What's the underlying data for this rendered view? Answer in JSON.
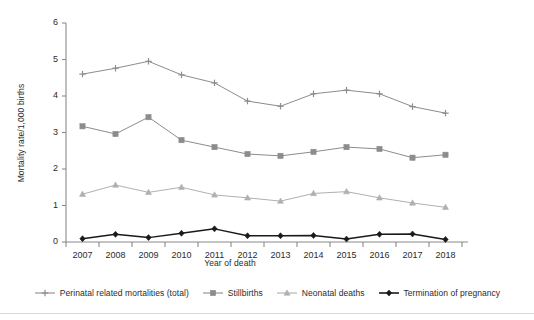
{
  "chart_data": {
    "type": "line",
    "title": "",
    "xlabel": "Year of death",
    "ylabel": "Mortality rate/1,000 births",
    "categories": [
      "2007",
      "2008",
      "2009",
      "2010",
      "2011",
      "2012",
      "2013",
      "2014",
      "2015",
      "2016",
      "2017",
      "2018"
    ],
    "x": [
      2007,
      2008,
      2009,
      2010,
      2011,
      2012,
      2013,
      2014,
      2015,
      2016,
      2017,
      2018
    ],
    "xlim": [
      2006.5,
      2018.5
    ],
    "ylim": [
      0,
      6
    ],
    "yticks": [
      0,
      1,
      2,
      3,
      4,
      5,
      6
    ],
    "ytick_labels": [
      "0",
      "1",
      "2",
      "3",
      "4",
      "5",
      "6"
    ],
    "grid": false,
    "legend_position": "bottom",
    "series": [
      {
        "name": "Perinatal related mortalities (total)",
        "marker": "plus",
        "color": "#8c8c8c",
        "values": [
          4.6,
          4.76,
          4.95,
          4.58,
          4.36,
          3.86,
          3.72,
          4.06,
          4.16,
          4.06,
          3.71,
          3.53
        ]
      },
      {
        "name": "Stillbirths",
        "marker": "square",
        "color": "#8c8c8c",
        "values": [
          3.17,
          2.96,
          3.42,
          2.79,
          2.6,
          2.41,
          2.36,
          2.47,
          2.6,
          2.55,
          2.31,
          2.39
        ]
      },
      {
        "name": "Neonatal deaths",
        "marker": "triangle",
        "color": "#b0b0b0",
        "values": [
          1.31,
          1.56,
          1.36,
          1.5,
          1.29,
          1.21,
          1.12,
          1.33,
          1.38,
          1.21,
          1.07,
          0.95
        ]
      },
      {
        "name": "Termination of pregnancy",
        "marker": "diamond",
        "color": "#1a1a1a",
        "values": [
          0.09,
          0.21,
          0.12,
          0.24,
          0.36,
          0.17,
          0.17,
          0.18,
          0.08,
          0.21,
          0.22,
          0.07
        ]
      }
    ]
  },
  "axes": {
    "y_title": "Mortality rate/1,000 births",
    "x_title": "Year of death"
  },
  "legend": {
    "items": [
      {
        "label": "Perinatal related mortalities (total)",
        "marker": "plus",
        "color": "#8c8c8c"
      },
      {
        "label": "Stillbirths",
        "marker": "square",
        "color": "#8c8c8c"
      },
      {
        "label": "Neonatal deaths",
        "marker": "triangle",
        "color": "#b0b0b0"
      },
      {
        "label": "Termination of pregnancy",
        "marker": "diamond",
        "color": "#1a1a1a"
      }
    ]
  },
  "colors": {
    "axis": "#8a8a8a",
    "text": "#2b2b2b",
    "background": "#ffffff",
    "series_light": "#b0b0b0",
    "series_mid": "#8c8c8c",
    "series_dark": "#1a1a1a"
  }
}
